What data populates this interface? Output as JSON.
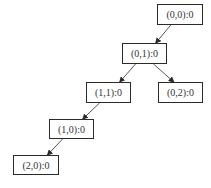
{
  "diagram": {
    "type": "tree",
    "nodes": [
      {
        "id": "n00",
        "label": "(0,0):0",
        "x": 157,
        "y": 4,
        "w": 46,
        "h": 21
      },
      {
        "id": "n01",
        "label": "(0,1):0",
        "x": 122,
        "y": 43,
        "w": 45,
        "h": 21
      },
      {
        "id": "n11",
        "label": "(1,1):0",
        "x": 86,
        "y": 82,
        "w": 45,
        "h": 21
      },
      {
        "id": "n02",
        "label": "(0,2):0",
        "x": 158,
        "y": 82,
        "w": 45,
        "h": 21
      },
      {
        "id": "n10",
        "label": "(1,0):0",
        "x": 49,
        "y": 119,
        "w": 45,
        "h": 20
      },
      {
        "id": "n20",
        "label": "(2,0):0",
        "x": 13,
        "y": 155,
        "w": 46,
        "h": 20
      }
    ],
    "edges": [
      {
        "from": "n00",
        "to": "n01"
      },
      {
        "from": "n01",
        "to": "n11"
      },
      {
        "from": "n01",
        "to": "n02"
      },
      {
        "from": "n11",
        "to": "n10"
      },
      {
        "from": "n10",
        "to": "n20"
      }
    ],
    "colors": {
      "stroke": "#2a2a2a",
      "text": "#333333",
      "background": "#ffffff"
    }
  }
}
